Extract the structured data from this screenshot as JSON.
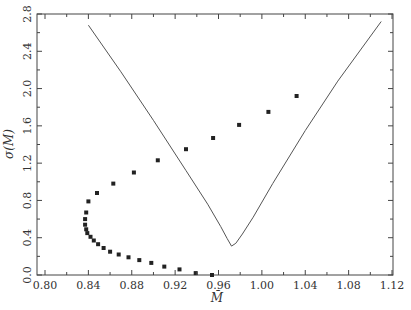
{
  "chart_data": {
    "type": "scatter",
    "title": "",
    "xlabel": "M̄",
    "ylabel": "σ(M)",
    "xlim": [
      0.793,
      1.12
    ],
    "ylim": [
      0.0,
      2.8
    ],
    "xticks": [
      0.8,
      0.84,
      0.88,
      0.92,
      0.96,
      1.0,
      1.04,
      1.08,
      1.12
    ],
    "xtick_labels": [
      "0.80",
      "0.84",
      "0.88",
      "0.92",
      "0.96",
      "1.00",
      "1.04",
      "1.08",
      "1.12"
    ],
    "yticks": [
      0.0,
      0.4,
      0.8,
      1.2,
      1.6,
      2.0,
      2.4,
      2.8
    ],
    "ytick_labels": [
      "0.0",
      "0.4",
      "0.8",
      "1.2",
      "1.6",
      "2.0",
      "2.4",
      "2.8"
    ],
    "grid": false,
    "legend": null,
    "series": [
      {
        "name": "curve",
        "kind": "line",
        "x": [
          0.84,
          0.87,
          0.9,
          0.93,
          0.95,
          0.962,
          0.968,
          0.972,
          0.976,
          0.982,
          0.992,
          1.01,
          1.04,
          1.07,
          1.11
        ],
        "y": [
          2.68,
          2.18,
          1.66,
          1.12,
          0.76,
          0.52,
          0.39,
          0.31,
          0.34,
          0.44,
          0.62,
          0.98,
          1.55,
          2.08,
          2.72
        ]
      },
      {
        "name": "points",
        "kind": "scatter",
        "x": [
          1.032,
          1.006,
          0.979,
          0.955,
          0.93,
          0.904,
          0.882,
          0.863,
          0.848,
          0.84,
          0.838,
          0.837,
          0.837,
          0.838,
          0.839,
          0.842,
          0.845,
          0.849,
          0.854,
          0.86,
          0.868,
          0.877,
          0.887,
          0.898,
          0.91,
          0.924,
          0.939,
          0.954
        ],
        "y": [
          1.92,
          1.75,
          1.61,
          1.47,
          1.35,
          1.23,
          1.1,
          0.98,
          0.88,
          0.79,
          0.67,
          0.6,
          0.54,
          0.49,
          0.45,
          0.41,
          0.37,
          0.33,
          0.29,
          0.25,
          0.22,
          0.19,
          0.16,
          0.13,
          0.09,
          0.06,
          0.02,
          0.0
        ]
      }
    ]
  },
  "colors": {
    "line": "#555555",
    "points": "#222222",
    "axis": "#444444"
  }
}
